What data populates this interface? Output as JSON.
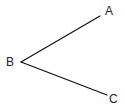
{
  "diagram": {
    "type": "angle",
    "vertex": {
      "label": "B",
      "x": 21,
      "y": 62
    },
    "rays": [
      {
        "label": "A",
        "end_x": 100,
        "end_y": 16
      },
      {
        "label": "C",
        "end_x": 107,
        "end_y": 95
      }
    ],
    "line_color": "#111111",
    "label_color": "#222222"
  }
}
